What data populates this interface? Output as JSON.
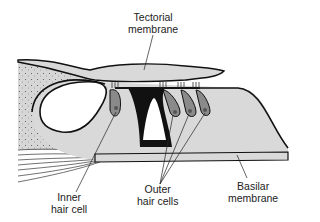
{
  "labels": {
    "tectorial": {
      "line1": "Tectorial",
      "line2": "membrane"
    },
    "inner": {
      "line1": "Inner",
      "line2": "hair cell"
    },
    "outer": {
      "line1": "Outer",
      "line2": "hair cells"
    },
    "basilar": {
      "line1": "Basilar",
      "line2": "membrane"
    }
  },
  "colors": {
    "fill_light": "#d9d9d9",
    "fill_stipple": "#cfcfcf",
    "cell": "#8a8a8a",
    "outline": "#111111"
  }
}
